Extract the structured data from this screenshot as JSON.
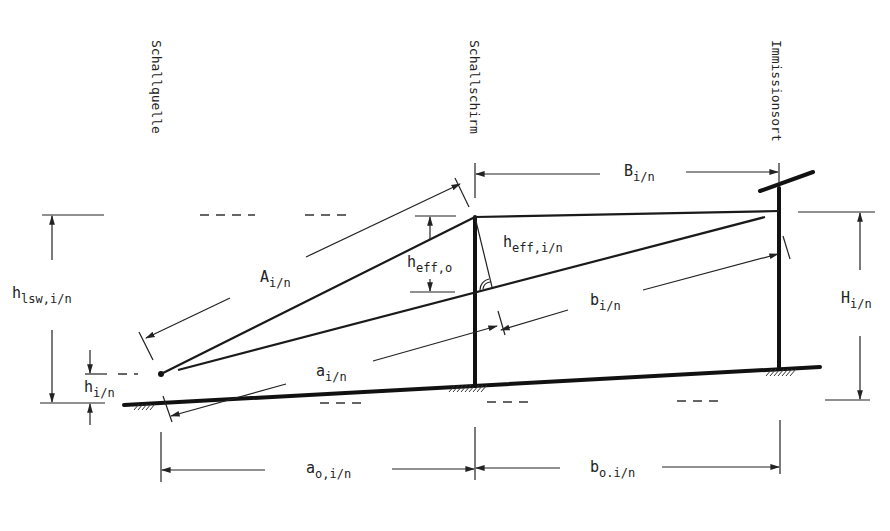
{
  "diagram": {
    "columns": {
      "source": "Schallquelle",
      "screen": "Schallschirm",
      "receiver": "Immissionsort"
    },
    "labels": {
      "A": {
        "main": "A",
        "sub": "i/n"
      },
      "B": {
        "main": "B",
        "sub": "i/n"
      },
      "a": {
        "main": "a",
        "sub": "i/n"
      },
      "b": {
        "main": "b",
        "sub": "i/n"
      },
      "H": {
        "main": "H",
        "sub": "i/n"
      },
      "h_lsw": {
        "main": "h",
        "sub": "lsw,i/n"
      },
      "h_i": {
        "main": "h",
        "sub": "i/n"
      },
      "h_eff_o": {
        "main": "h",
        "sub": "eff,o"
      },
      "h_eff_in": {
        "main": "h",
        "sub": "eff,i/n"
      },
      "a_o": {
        "main": "a",
        "sub": "o,i/n"
      },
      "b_o": {
        "main": "b",
        "sub": "o.i/n"
      }
    },
    "colors": {
      "ink": "#1a1a1a",
      "background": "#ffffff"
    }
  }
}
